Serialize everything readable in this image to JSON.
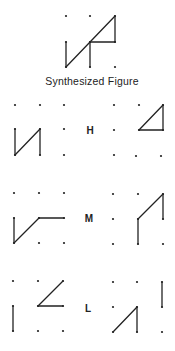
{
  "title": "Synthesized Figure",
  "colors": {
    "ink": "#222222",
    "background": "#ffffff"
  },
  "synthesized": {
    "dots": [
      [
        66,
        16
      ],
      [
        90,
        16
      ],
      [
        115,
        16
      ],
      [
        66,
        42
      ],
      [
        90,
        42
      ],
      [
        115,
        42
      ],
      [
        66,
        67
      ],
      [
        90,
        67
      ],
      [
        115,
        67
      ]
    ],
    "lines": [
      [
        [
          66,
          42
        ],
        [
          66,
          67
        ]
      ],
      [
        [
          66,
          67
        ],
        [
          115,
          16
        ]
      ],
      [
        [
          90,
          42
        ],
        [
          90,
          67
        ]
      ],
      [
        [
          90,
          42
        ],
        [
          115,
          42
        ]
      ],
      [
        [
          115,
          16
        ],
        [
          115,
          42
        ]
      ]
    ]
  },
  "rows": [
    {
      "label": "H",
      "label_pos": [
        90,
        134
      ],
      "left": {
        "dots": [
          [
            15,
            105
          ],
          [
            40,
            105
          ],
          [
            64,
            105
          ],
          [
            15,
            129
          ],
          [
            40,
            129
          ],
          [
            64,
            129
          ],
          [
            15,
            155
          ],
          [
            40,
            155
          ],
          [
            64,
            155
          ]
        ],
        "lines": [
          [
            [
              15,
              129
            ],
            [
              15,
              155
            ]
          ],
          [
            [
              15,
              155
            ],
            [
              40,
              129
            ]
          ],
          [
            [
              40,
              129
            ],
            [
              40,
              155
            ]
          ]
        ]
      },
      "right": {
        "dots": [
          [
            114,
            105
          ],
          [
            139,
            105
          ],
          [
            163,
            105
          ],
          [
            114,
            130
          ],
          [
            139,
            130
          ],
          [
            163,
            130
          ],
          [
            114,
            155
          ],
          [
            136,
            156
          ],
          [
            161,
            156
          ]
        ],
        "lines": [
          [
            [
              139,
              130
            ],
            [
              163,
              105
            ]
          ],
          [
            [
              163,
              105
            ],
            [
              163,
              130
            ]
          ],
          [
            [
              163,
              130
            ],
            [
              139,
              130
            ]
          ]
        ]
      }
    },
    {
      "label": "M",
      "label_pos": [
        89,
        222
      ],
      "left": {
        "dots": [
          [
            14,
            193
          ],
          [
            39,
            193
          ],
          [
            64,
            193
          ],
          [
            14,
            218
          ],
          [
            39,
            218
          ],
          [
            64,
            218
          ],
          [
            14,
            243
          ],
          [
            39,
            243
          ],
          [
            64,
            243
          ]
        ],
        "lines": [
          [
            [
              14,
              218
            ],
            [
              14,
              243
            ]
          ],
          [
            [
              14,
              243
            ],
            [
              39,
              218
            ]
          ],
          [
            [
              39,
              218
            ],
            [
              64,
              218
            ]
          ]
        ]
      },
      "right": {
        "dots": [
          [
            113,
            194
          ],
          [
            138,
            194
          ],
          [
            163,
            194
          ],
          [
            113,
            219
          ],
          [
            138,
            219
          ],
          [
            163,
            219
          ],
          [
            113,
            244
          ],
          [
            138,
            244
          ],
          [
            163,
            244
          ]
        ],
        "lines": [
          [
            [
              138,
              219
            ],
            [
              138,
              244
            ]
          ],
          [
            [
              138,
              219
            ],
            [
              163,
              194
            ]
          ],
          [
            [
              163,
              194
            ],
            [
              163,
              219
            ]
          ]
        ]
      }
    },
    {
      "label": "L",
      "label_pos": [
        88,
        312
      ],
      "left": {
        "dots": [
          [
            13,
            281
          ],
          [
            38,
            281
          ],
          [
            63,
            281
          ],
          [
            13,
            306
          ],
          [
            38,
            306
          ],
          [
            63,
            306
          ],
          [
            13,
            331
          ],
          [
            38,
            331
          ],
          [
            63,
            331
          ]
        ],
        "lines": [
          [
            [
              13,
              306
            ],
            [
              13,
              331
            ]
          ],
          [
            [
              38,
              306
            ],
            [
              63,
              281
            ]
          ],
          [
            [
              38,
              306
            ],
            [
              63,
              306
            ]
          ]
        ]
      },
      "right": {
        "dots": [
          [
            113,
            282
          ],
          [
            137,
            282
          ],
          [
            162,
            282
          ],
          [
            113,
            307
          ],
          [
            137,
            307
          ],
          [
            162,
            307
          ],
          [
            113,
            332
          ],
          [
            137,
            332
          ],
          [
            162,
            332
          ]
        ],
        "lines": [
          [
            [
              162,
              282
            ],
            [
              162,
              307
            ]
          ],
          [
            [
              113,
              332
            ],
            [
              137,
              307
            ]
          ],
          [
            [
              137,
              307
            ],
            [
              137,
              332
            ]
          ]
        ]
      }
    }
  ]
}
